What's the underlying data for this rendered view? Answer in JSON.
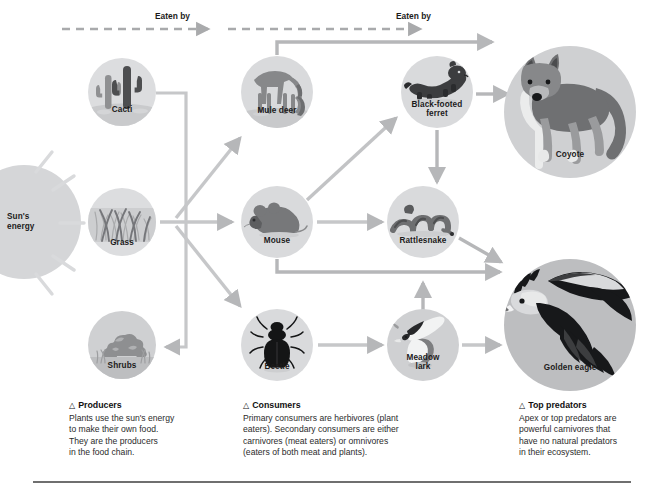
{
  "diagram": {
    "top_clipped_text": "",
    "flow_labels": [
      {
        "text": "Eaten by",
        "x": 155,
        "y": 12
      },
      {
        "text": "Eaten by",
        "x": 396,
        "y": 12
      }
    ],
    "nodes": [
      {
        "id": "sun",
        "label": "Sun's\nenergy",
        "label_line1": "Sun's",
        "label_line2": "energy",
        "kind": "sun",
        "cx": 25,
        "cy": 222,
        "r": 57
      },
      {
        "id": "cacti",
        "label": "Cacti",
        "kind": "producer",
        "cx": 122,
        "cy": 92,
        "r": 34
      },
      {
        "id": "grass",
        "label": "Grass",
        "kind": "producer",
        "cx": 122,
        "cy": 222,
        "r": 34
      },
      {
        "id": "shrubs",
        "label": "Shrubs",
        "kind": "producer",
        "cx": 122,
        "cy": 345,
        "r": 34
      },
      {
        "id": "muledeer",
        "label": "Mule deer",
        "kind": "consumer",
        "cx": 277,
        "cy": 92,
        "r": 36
      },
      {
        "id": "mouse",
        "label": "Mouse",
        "kind": "consumer",
        "cx": 277,
        "cy": 222,
        "r": 36
      },
      {
        "id": "beetle",
        "label": "Beetle",
        "kind": "consumer",
        "cx": 277,
        "cy": 345,
        "r": 36
      },
      {
        "id": "ferret",
        "label": "Black-footed\nferret",
        "label_line1": "Black-footed",
        "label_line2": "ferret",
        "kind": "consumer",
        "cx": 437,
        "cy": 92,
        "r": 36
      },
      {
        "id": "rattlesnake",
        "label": "Rattlesnake",
        "kind": "consumer",
        "cx": 423,
        "cy": 222,
        "r": 36
      },
      {
        "id": "meadowlark",
        "label": "Meadow\nlark",
        "label_line1": "Meadow",
        "label_line2": "lark",
        "kind": "consumer",
        "cx": 423,
        "cy": 345,
        "r": 36
      },
      {
        "id": "coyote",
        "label": "Coyote",
        "kind": "predator",
        "cx": 570,
        "cy": 112,
        "r": 66
      },
      {
        "id": "goldeneagle",
        "label": "Golden eagle",
        "kind": "predator",
        "cx": 570,
        "cy": 325,
        "r": 66
      }
    ],
    "links": [
      {
        "from": "grass",
        "to": "muledeer"
      },
      {
        "from": "grass",
        "to": "mouse"
      },
      {
        "from": "grass",
        "to": "beetle"
      },
      {
        "from": "cacti",
        "to": "shrubs"
      },
      {
        "from": "mouse",
        "to": "rattlesnake"
      },
      {
        "from": "mouse",
        "to": "ferret"
      },
      {
        "from": "ferret",
        "to": "coyote"
      },
      {
        "from": "ferret",
        "to": "rattlesnake"
      },
      {
        "from": "rattlesnake",
        "to": "coyote"
      },
      {
        "from": "rattlesnake",
        "to": "goldeneagle"
      },
      {
        "from": "mouse",
        "to": "goldeneagle"
      },
      {
        "from": "muledeer",
        "to": "coyote"
      },
      {
        "from": "beetle",
        "to": "meadowlark"
      },
      {
        "from": "meadowlark",
        "to": "rattlesnake"
      },
      {
        "from": "meadowlark",
        "to": "goldeneagle"
      }
    ]
  },
  "captions": [
    {
      "id": "producers",
      "heading": "Producers",
      "lines": [
        "Plants use the sun's energy",
        "to make their own food.",
        "They are the producers",
        "in the food chain."
      ]
    },
    {
      "id": "consumers",
      "heading": "Consumers",
      "lines": [
        "Primary consumers are herbivores (plant",
        "eaters). Secondary consumers are either",
        "carnivores (meat eaters) or omnivores",
        "(eaters of both meat and plants)."
      ]
    },
    {
      "id": "top-predators",
      "heading": "Top predators",
      "lines": [
        "Apex or top predators are",
        "powerful carnivores that",
        "have no natural predators",
        "in their ecosystem."
      ]
    }
  ],
  "colors": {
    "arrow": "#b6b7b9",
    "arrow_dark": "#a0a1a3",
    "circle_bg": "#d2d3d5",
    "circle_bg_light": "#e3e4e6",
    "sun": "#d5d6d8",
    "text": "#1c1b1b",
    "rule": "#6f6f6f",
    "dark_fig": "#3a3b3d",
    "mid_fig": "#7d7e80",
    "light_fig": "#eceded"
  }
}
